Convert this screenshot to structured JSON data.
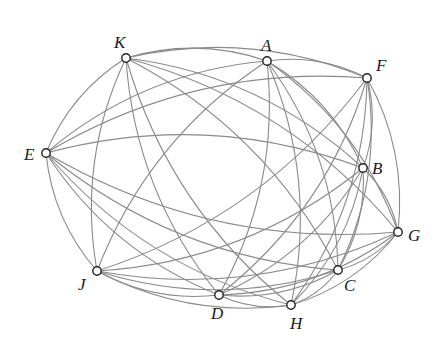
{
  "diagram": {
    "type": "complete-graph",
    "colors": {
      "edge": "#8a8a8a",
      "node_fill": "#ffffff",
      "node_stroke": "#222222",
      "label": "#1a1a1a"
    },
    "nodes": [
      {
        "id": "K",
        "label": "K",
        "x": 126,
        "y": 58,
        "lx": 114,
        "ly": 48
      },
      {
        "id": "A",
        "label": "A",
        "x": 267,
        "y": 61,
        "lx": 261,
        "ly": 51
      },
      {
        "id": "F",
        "label": "F",
        "x": 367,
        "y": 78,
        "lx": 376,
        "ly": 71
      },
      {
        "id": "E",
        "label": "E",
        "x": 46,
        "y": 153,
        "lx": 24,
        "ly": 160
      },
      {
        "id": "B",
        "label": "B",
        "x": 363,
        "y": 168,
        "lx": 372,
        "ly": 174
      },
      {
        "id": "G",
        "label": "G",
        "x": 398,
        "y": 232,
        "lx": 408,
        "ly": 241
      },
      {
        "id": "J",
        "label": "J",
        "x": 97,
        "y": 271,
        "lx": 78,
        "ly": 290
      },
      {
        "id": "D",
        "label": "D",
        "x": 219,
        "y": 295,
        "lx": 211,
        "ly": 319
      },
      {
        "id": "H",
        "label": "H",
        "x": 291,
        "y": 305,
        "lx": 290,
        "ly": 329
      },
      {
        "id": "C",
        "label": "C",
        "x": 338,
        "y": 270,
        "lx": 344,
        "ly": 291
      }
    ],
    "edges": [
      [
        "K",
        "A"
      ],
      [
        "K",
        "F"
      ],
      [
        "K",
        "E"
      ],
      [
        "K",
        "B"
      ],
      [
        "K",
        "G"
      ],
      [
        "K",
        "J"
      ],
      [
        "K",
        "D"
      ],
      [
        "K",
        "H"
      ],
      [
        "K",
        "C"
      ],
      [
        "A",
        "F"
      ],
      [
        "A",
        "E"
      ],
      [
        "A",
        "B"
      ],
      [
        "A",
        "G"
      ],
      [
        "A",
        "J"
      ],
      [
        "A",
        "D"
      ],
      [
        "A",
        "H"
      ],
      [
        "A",
        "C"
      ],
      [
        "F",
        "E"
      ],
      [
        "F",
        "B"
      ],
      [
        "F",
        "G"
      ],
      [
        "F",
        "J"
      ],
      [
        "F",
        "D"
      ],
      [
        "F",
        "H"
      ],
      [
        "F",
        "C"
      ],
      [
        "E",
        "B"
      ],
      [
        "E",
        "G"
      ],
      [
        "E",
        "J"
      ],
      [
        "E",
        "D"
      ],
      [
        "E",
        "H"
      ],
      [
        "E",
        "C"
      ],
      [
        "B",
        "G"
      ],
      [
        "B",
        "J"
      ],
      [
        "B",
        "D"
      ],
      [
        "B",
        "H"
      ],
      [
        "B",
        "C"
      ],
      [
        "G",
        "J"
      ],
      [
        "G",
        "D"
      ],
      [
        "G",
        "H"
      ],
      [
        "G",
        "C"
      ],
      [
        "J",
        "D"
      ],
      [
        "J",
        "H"
      ],
      [
        "J",
        "C"
      ],
      [
        "D",
        "H"
      ],
      [
        "D",
        "C"
      ],
      [
        "H",
        "C"
      ]
    ],
    "center": {
      "x": 222,
      "y": 180
    },
    "bend": 0.16
  }
}
